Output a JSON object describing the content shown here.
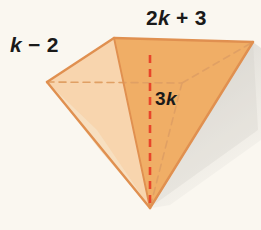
{
  "figure": {
    "name": "rectangular-pyramid",
    "background_color": "#faf7f0",
    "labels": {
      "top_edge": "2k + 3",
      "left_edge": "k − 2",
      "height": "3k"
    },
    "colors": {
      "face_right": "#f0ae66",
      "face_top_left": "#f5c893",
      "face_front_center": "#f8d5ae",
      "face_bottom_left": "#f7dfc0",
      "outline": "#e09050",
      "outline_dark": "#d87f3c",
      "hidden_edge": "#e0a064",
      "altitude": "#e8452a",
      "shadow": "#cfcdc8",
      "text": "#1a1a1a"
    },
    "vertices": {
      "base_top_left": [
        114,
        38
      ],
      "base_top_right": [
        253,
        42
      ],
      "base_left": [
        47,
        82
      ],
      "base_back_hidden": [
        182,
        83
      ],
      "apex": [
        150,
        208
      ]
    }
  }
}
